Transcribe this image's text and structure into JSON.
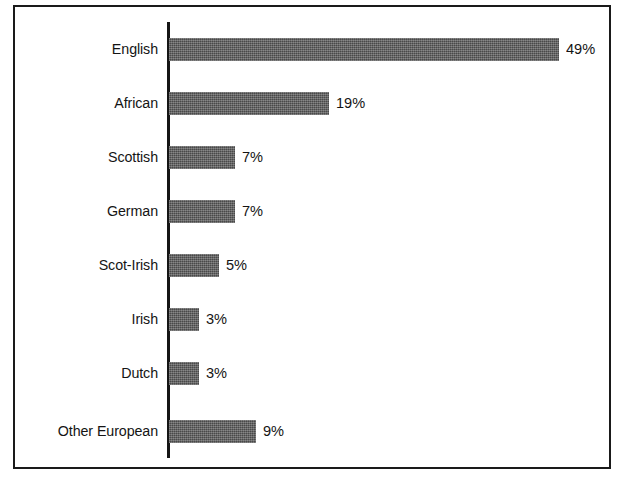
{
  "chart_data": {
    "type": "bar",
    "orientation": "horizontal",
    "title": "",
    "subtitle": "",
    "xlabel": "",
    "ylabel": "",
    "grid": false,
    "legend": null,
    "axis_ticks": [],
    "value_suffix": "%",
    "xlim": [
      0,
      49
    ],
    "categories": [
      "English",
      "African",
      "Scottish",
      "German",
      "Scot-Irish",
      "Irish",
      "Dutch",
      "Other European"
    ],
    "values": [
      49,
      19,
      7,
      7,
      5,
      3,
      3,
      9
    ],
    "value_labels": [
      "49%",
      "19%",
      "7%",
      "7%",
      "5%",
      "3%",
      "3%",
      "9%"
    ],
    "bar_pixel_widths": [
      390,
      160,
      66,
      66,
      50,
      30,
      30,
      87
    ],
    "colors": {
      "bar_fill": "#585858",
      "axis": "#151515",
      "frame": "#1a1a1a",
      "text": "#141414",
      "background": "#ffffff"
    }
  },
  "bars": [
    {
      "label": "English",
      "value_label": "49%",
      "width": 390
    },
    {
      "label": "African",
      "value_label": "19%",
      "width": 160
    },
    {
      "label": "Scottish",
      "value_label": "7%",
      "width": 66
    },
    {
      "label": "German",
      "value_label": "7%",
      "width": 66
    },
    {
      "label": "Scot-Irish",
      "value_label": "5%",
      "width": 50
    },
    {
      "label": "Irish",
      "value_label": "3%",
      "width": 30
    },
    {
      "label": "Dutch",
      "value_label": "3%",
      "width": 30
    },
    {
      "label": "Other European",
      "value_label": "9%",
      "width": 87
    }
  ]
}
